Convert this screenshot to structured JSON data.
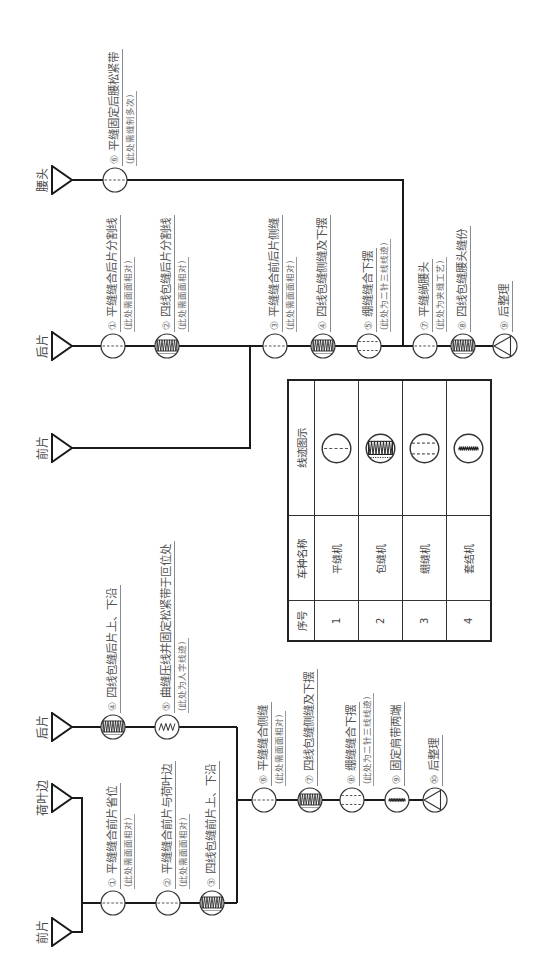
{
  "flow_left": {
    "inputs": {
      "front_piece": "前片",
      "ruffle": "荷叶边",
      "back_piece": "后片"
    },
    "steps": [
      {
        "no": "①",
        "text": "平缝缝合前片省位",
        "note": "(此处需面面相对)",
        "stitch": "lockstitch-icon"
      },
      {
        "no": "②",
        "text": "平缝缝合前片与荷叶边",
        "note": "(此处需面面相对)",
        "stitch": "lockstitch-icon"
      },
      {
        "no": "③",
        "text": "四线包缝前片上、下沿",
        "stitch": "overlock-icon"
      },
      {
        "no": "④",
        "text": "四线包缝后片上、下沿",
        "stitch": "overlock-icon"
      },
      {
        "no": "⑤",
        "text": "曲缝压线并固定松紧带于叵位处",
        "note": "(此处为人字线迹)",
        "stitch": "zigzag-stitch-icon"
      },
      {
        "no": "⑥",
        "text": "平缝缝合侧缝",
        "note": "(此处需面面相对)",
        "stitch": "lockstitch-icon"
      },
      {
        "no": "⑦",
        "text": "四线包缝侧缝及下摆",
        "stitch": "overlock-icon"
      },
      {
        "no": "⑧",
        "text": "绷缝缝合下摆",
        "note": "(此处为二针三线线迹)",
        "stitch": "coverstitch-icon"
      },
      {
        "no": "⑨",
        "text": "固定肩带两端",
        "stitch": "bartack-icon"
      },
      {
        "no": "⑩",
        "text": "后整理",
        "stitch": "finishing-icon"
      }
    ]
  },
  "flow_right": {
    "inputs": {
      "front_piece": "前片",
      "back_piece": "后片",
      "waistband": "腰头"
    },
    "steps": [
      {
        "no": "①",
        "text": "平缝缝合后片分割线",
        "note": "(此处需面面相对)",
        "stitch": "lockstitch-icon"
      },
      {
        "no": "②",
        "text": "四线包缝后片分割线",
        "note": "(此处需面面相对)",
        "stitch": "overlock-icon"
      },
      {
        "no": "③",
        "text": "平缝缝合前后片侧缝",
        "note": "(此处需面面相对)",
        "stitch": "lockstitch-icon"
      },
      {
        "no": "④",
        "text": "四线包缝侧缝及下摆",
        "stitch": "overlock-icon"
      },
      {
        "no": "⑤",
        "text": "绷缝缝合下摆",
        "note": "(此处为二针三线线迹)",
        "stitch": "coverstitch-icon"
      },
      {
        "no": "⑥",
        "text": "平缝固定后腰松紧带",
        "note": "(此处需缝制多次)",
        "stitch": "lockstitch-icon"
      },
      {
        "no": "⑦",
        "text": "平缝绱腰头",
        "note": "(此处为夹缝工艺)",
        "stitch": "lockstitch-icon"
      },
      {
        "no": "⑧",
        "text": "四线包缝腰头缝份",
        "stitch": "overlock-icon"
      },
      {
        "no": "⑨",
        "text": "后整理",
        "stitch": "finishing-icon"
      }
    ]
  },
  "legend": {
    "headers": [
      "序号",
      "车种名称",
      "线迹图示"
    ],
    "rows": [
      {
        "no": "1",
        "machine": "平缝机",
        "stitch": "lockstitch-icon"
      },
      {
        "no": "2",
        "machine": "包缝机",
        "stitch": "overlock-icon"
      },
      {
        "no": "3",
        "machine": "绷缝机",
        "stitch": "coverstitch-icon"
      },
      {
        "no": "4",
        "machine": "套结机",
        "stitch": "bartack-icon"
      }
    ]
  },
  "colors": {
    "line": "#1a1a1a",
    "text": "#555555",
    "background": "#ffffff"
  }
}
